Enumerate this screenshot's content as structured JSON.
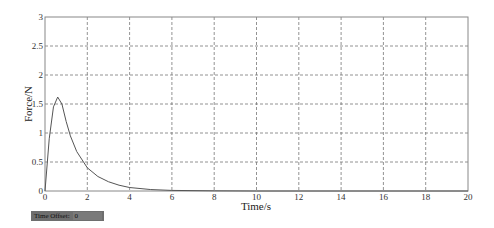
{
  "chart_data": {
    "type": "line",
    "title": "",
    "xlabel": "Time/s",
    "ylabel": "Force/N",
    "xlim": [
      0,
      20
    ],
    "ylim": [
      0,
      3
    ],
    "grid": true,
    "xticks": [
      0,
      2,
      4,
      6,
      8,
      10,
      12,
      14,
      16,
      18,
      20
    ],
    "yticks": [
      0,
      0.5,
      1,
      1.5,
      2,
      2.5,
      3
    ],
    "series": [
      {
        "name": "Force",
        "x": [
          0,
          0.2,
          0.4,
          0.6,
          0.8,
          1.0,
          1.2,
          1.5,
          2.0,
          2.5,
          3.0,
          3.5,
          4.0,
          5.0,
          6.0,
          8.0,
          10.0,
          20.0
        ],
        "y": [
          0,
          0.9,
          1.45,
          1.62,
          1.5,
          1.2,
          0.95,
          0.68,
          0.4,
          0.25,
          0.16,
          0.1,
          0.06,
          0.025,
          0.01,
          0.003,
          0.0,
          0.0
        ]
      }
    ]
  },
  "footer": {
    "time_offset_label": "Time Offset:",
    "time_offset_value": "0"
  }
}
